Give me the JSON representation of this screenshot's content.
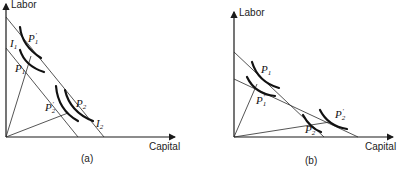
{
  "figure": {
    "panels": [
      {
        "id": "a",
        "caption": "(a)",
        "y_axis_label": "Labor",
        "x_axis_label": "Capital",
        "labels": {
          "I1": {
            "base": "I",
            "sub": "1"
          },
          "P1prime": {
            "base": "P",
            "sub": "1",
            "prime": "′"
          },
          "P1": {
            "base": "P",
            "sub": "1"
          },
          "P2prime": {
            "base": "P",
            "sub": "2",
            "prime": "′"
          },
          "P2": {
            "base": "P",
            "sub": "2"
          },
          "I2": {
            "base": "I",
            "sub": "2"
          }
        }
      },
      {
        "id": "b",
        "caption": "(b)",
        "y_axis_label": "Labor",
        "x_axis_label": "Capital",
        "labels": {
          "P1": {
            "base": "P",
            "sub": "1"
          },
          "P1prime": {
            "base": "P",
            "sub": "1",
            "prime": "′"
          },
          "P2": {
            "base": "P",
            "sub": "2"
          },
          "P2prime": {
            "base": "P",
            "sub": "2",
            "prime": "′"
          }
        }
      }
    ]
  }
}
